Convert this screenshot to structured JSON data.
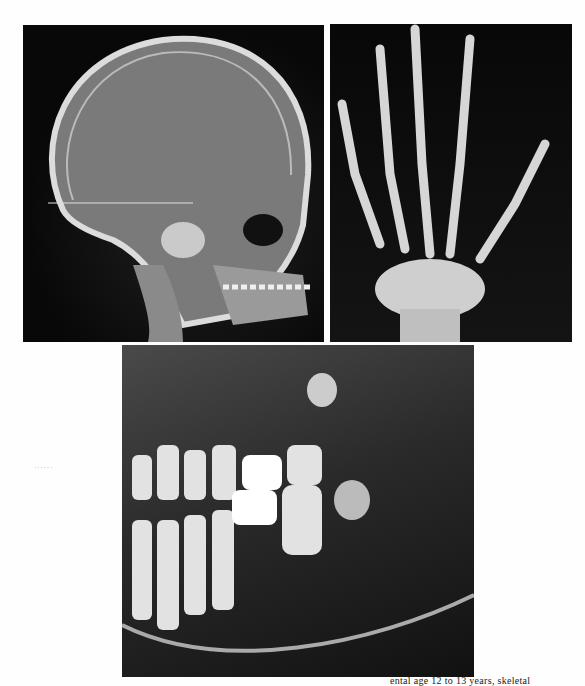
{
  "figure": {
    "panels": [
      {
        "id": "skull",
        "label": "Lateral cephalometric radiograph"
      },
      {
        "id": "hand",
        "label": "Hand-wrist radiograph"
      },
      {
        "id": "pano",
        "label": "Panoramic dental radiograph"
      }
    ],
    "side_marker": "R",
    "margin_mark": "......",
    "caption_fragment": "ental age 12 to 13 years, skeletal"
  },
  "colors": {
    "film": "#0a0a0a",
    "bone": "#e8e8e8",
    "page": "#fefefe"
  }
}
